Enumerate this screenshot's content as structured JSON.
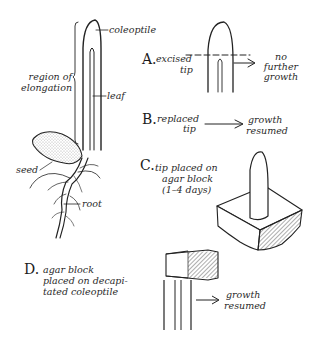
{
  "diagram": {
    "seedling": {
      "labels": {
        "coleoptile": "coleoptile",
        "region_line1": "region of",
        "region_line2": "elongation",
        "leaf": "leaf",
        "seed": "seed",
        "root": "root"
      }
    },
    "experiments": [
      {
        "letter": "A.",
        "description_line1": "excised",
        "description_line2": "tip",
        "result_line1": "no",
        "result_line2": "further",
        "result_line3": "growth"
      },
      {
        "letter": "B.",
        "description_line1": "replaced",
        "description_line2": "tip",
        "result_line1": "growth",
        "result_line2": "resumed"
      },
      {
        "letter": "C.",
        "description_line1": "tip placed on",
        "description_line2": "agar block",
        "description_line3": "(1–4 days)"
      },
      {
        "letter": "D.",
        "description_line1": "agar block",
        "description_line2": "placed on decapi-",
        "description_line3": "tated coleoptile",
        "result_line1": "growth",
        "result_line2": "resumed"
      }
    ],
    "colors": {
      "ink": "#222222",
      "background": "#ffffff"
    }
  }
}
